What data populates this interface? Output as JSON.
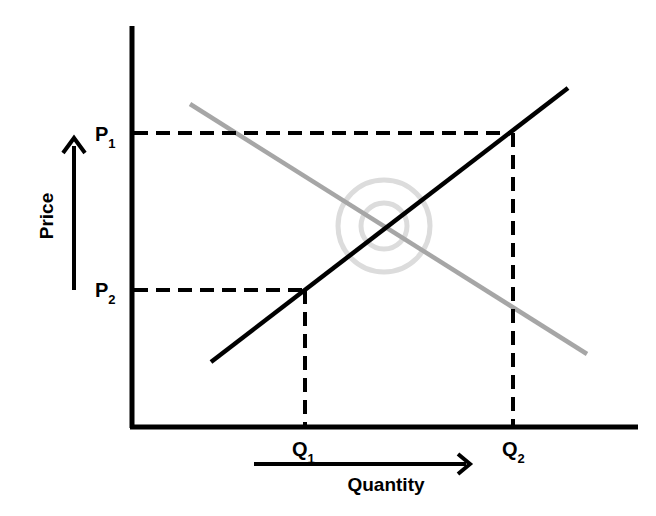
{
  "diagram": {
    "type": "supply-demand",
    "axes": {
      "y_label": "Price",
      "x_label": "Quantity"
    },
    "price_levels": [
      {
        "base": "P",
        "sub": "1"
      },
      {
        "base": "P",
        "sub": "2"
      }
    ],
    "quantity_levels": [
      {
        "base": "Q",
        "sub": "1"
      },
      {
        "base": "Q",
        "sub": "2"
      }
    ],
    "curves": [
      {
        "name": "supply",
        "color": "#000000"
      },
      {
        "name": "demand",
        "color": "#a6a6a6"
      }
    ],
    "equilibrium_marker_color": "#dcdcdc"
  }
}
